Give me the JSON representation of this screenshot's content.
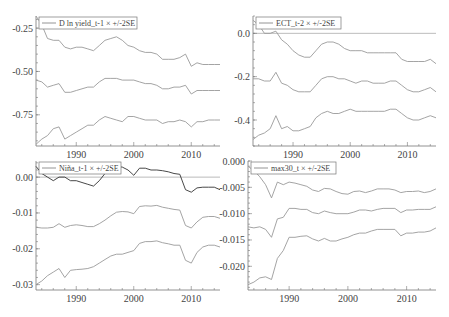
{
  "chart_data": [
    {
      "type": "line",
      "panel": "top-left",
      "legend": "D ln yield_t-1 × +/-2SE",
      "xlabel": "",
      "ylabel": "",
      "xlim": [
        1983,
        2015
      ],
      "ylim": [
        -0.93,
        -0.18
      ],
      "yticks": [
        -0.25,
        -0.5,
        -0.75
      ],
      "ytick_labels": [
        "-0.25",
        "-0.50",
        "-0.75"
      ],
      "xticks": [
        1990,
        2000,
        2010
      ],
      "xtick_labels": [
        "1990",
        "2000",
        "2010"
      ],
      "zero_line": false,
      "x": [
        1983,
        1984,
        1985,
        1986,
        1987,
        1988,
        1989,
        1990,
        1991,
        1992,
        1993,
        1994,
        1995,
        1996,
        1997,
        1998,
        1999,
        2000,
        2001,
        2002,
        2003,
        2004,
        2005,
        2006,
        2007,
        2008,
        2009,
        2010,
        2011,
        2012,
        2013,
        2014,
        2015
      ],
      "series": [
        {
          "name": "upper (+2SE)",
          "values": [
            -0.18,
            -0.23,
            -0.31,
            -0.32,
            -0.32,
            -0.36,
            -0.37,
            -0.36,
            -0.36,
            -0.37,
            -0.38,
            -0.35,
            -0.32,
            -0.31,
            -0.3,
            -0.32,
            -0.35,
            -0.36,
            -0.38,
            -0.39,
            -0.39,
            -0.4,
            -0.43,
            -0.43,
            -0.43,
            -0.42,
            -0.4,
            -0.47,
            -0.45,
            -0.46,
            -0.46,
            -0.46,
            -0.46
          ]
        },
        {
          "name": "estimate",
          "values": [
            -0.55,
            -0.56,
            -0.59,
            -0.58,
            -0.57,
            -0.62,
            -0.62,
            -0.61,
            -0.6,
            -0.59,
            -0.59,
            -0.56,
            -0.54,
            -0.54,
            -0.54,
            -0.55,
            -0.55,
            -0.55,
            -0.56,
            -0.57,
            -0.57,
            -0.58,
            -0.6,
            -0.6,
            -0.59,
            -0.59,
            -0.58,
            -0.63,
            -0.61,
            -0.61,
            -0.61,
            -0.61,
            -0.61
          ]
        },
        {
          "name": "lower (-2SE)",
          "values": [
            -0.92,
            -0.89,
            -0.87,
            -0.83,
            -0.82,
            -0.89,
            -0.87,
            -0.85,
            -0.83,
            -0.81,
            -0.81,
            -0.78,
            -0.76,
            -0.77,
            -0.78,
            -0.79,
            -0.76,
            -0.76,
            -0.77,
            -0.78,
            -0.78,
            -0.78,
            -0.8,
            -0.79,
            -0.79,
            -0.78,
            -0.79,
            -0.82,
            -0.79,
            -0.79,
            -0.78,
            -0.78,
            -0.78
          ]
        }
      ]
    },
    {
      "type": "line",
      "panel": "top-right",
      "legend": "ECT_t-2 × +/-2SE",
      "xlabel": "",
      "ylabel": "",
      "xlim": [
        1983,
        2015
      ],
      "ylim": [
        -0.52,
        0.08
      ],
      "yticks": [
        0.0,
        -0.2,
        -0.4
      ],
      "ytick_labels": [
        "0.0",
        "-0.2",
        "-0.4"
      ],
      "xticks": [
        1990,
        2000,
        2010
      ],
      "xtick_labels": [
        "1990",
        "2000",
        "2010"
      ],
      "zero_line": true,
      "x": [
        1983,
        1984,
        1985,
        1986,
        1987,
        1988,
        1989,
        1990,
        1991,
        1992,
        1993,
        1994,
        1995,
        1996,
        1997,
        1998,
        1999,
        2000,
        2001,
        2002,
        2003,
        2004,
        2005,
        2006,
        2007,
        2008,
        2009,
        2010,
        2011,
        2012,
        2013,
        2014,
        2015
      ],
      "series": [
        {
          "name": "upper (+2SE)",
          "values": [
            0.06,
            0.04,
            0.0,
            0.0,
            0.01,
            -0.03,
            -0.05,
            -0.08,
            -0.1,
            -0.11,
            -0.11,
            -0.08,
            -0.05,
            -0.04,
            -0.04,
            -0.05,
            -0.07,
            -0.08,
            -0.08,
            -0.08,
            -0.09,
            -0.09,
            -0.09,
            -0.09,
            -0.09,
            -0.09,
            -0.12,
            -0.13,
            -0.13,
            -0.13,
            -0.13,
            -0.12,
            -0.14
          ]
        },
        {
          "name": "estimate",
          "values": [
            -0.21,
            -0.21,
            -0.22,
            -0.22,
            -0.18,
            -0.23,
            -0.24,
            -0.26,
            -0.27,
            -0.27,
            -0.27,
            -0.24,
            -0.21,
            -0.2,
            -0.2,
            -0.21,
            -0.21,
            -0.22,
            -0.23,
            -0.22,
            -0.22,
            -0.23,
            -0.23,
            -0.23,
            -0.22,
            -0.22,
            -0.24,
            -0.26,
            -0.27,
            -0.27,
            -0.26,
            -0.25,
            -0.27
          ]
        },
        {
          "name": "lower (-2SE)",
          "values": [
            -0.49,
            -0.47,
            -0.46,
            -0.44,
            -0.38,
            -0.44,
            -0.43,
            -0.45,
            -0.45,
            -0.44,
            -0.43,
            -0.39,
            -0.37,
            -0.36,
            -0.37,
            -0.37,
            -0.36,
            -0.35,
            -0.36,
            -0.36,
            -0.36,
            -0.36,
            -0.36,
            -0.36,
            -0.35,
            -0.35,
            -0.37,
            -0.39,
            -0.4,
            -0.4,
            -0.39,
            -0.38,
            -0.39
          ]
        }
      ]
    },
    {
      "type": "line",
      "panel": "bottom-left",
      "legend": "Niña_t-1 × +/-2SE",
      "xlabel": "",
      "ylabel": "",
      "xlim": [
        1983,
        2015
      ],
      "ylim": [
        -0.0315,
        0.0045
      ],
      "yticks": [
        0.0,
        -0.01,
        -0.02,
        -0.03
      ],
      "ytick_labels": [
        "0.00",
        "-0.01",
        "-0.02",
        "-0.03"
      ],
      "xticks": [
        1990,
        2000,
        2010
      ],
      "xtick_labels": [
        "1990",
        "2000",
        "2010"
      ],
      "zero_line": true,
      "x": [
        1983,
        1984,
        1985,
        1986,
        1987,
        1988,
        1989,
        1990,
        1991,
        1992,
        1993,
        1994,
        1995,
        1996,
        1997,
        1998,
        1999,
        2000,
        2001,
        2002,
        2003,
        2004,
        2005,
        2006,
        2007,
        2008,
        2009,
        2010,
        2011,
        2012,
        2013,
        2014,
        2015
      ],
      "series": [
        {
          "name": "upper (+2SE)",
          "values": [
            0.003,
            0.001,
            0.0,
            -0.001,
            0.0,
            0.0,
            -0.001,
            -0.001,
            -0.0015,
            -0.002,
            -0.0025,
            -0.001,
            0.001,
            0.002,
            0.003,
            0.0028,
            0.002,
            0.0005,
            0.0025,
            0.0025,
            0.002,
            0.002,
            0.0018,
            0.0015,
            0.001,
            0.0008,
            -0.0035,
            -0.0042,
            -0.003,
            -0.0028,
            -0.0028,
            -0.0028,
            -0.0035
          ]
        },
        {
          "name": "estimate",
          "values": [
            -0.014,
            -0.0142,
            -0.0142,
            -0.014,
            -0.013,
            -0.014,
            -0.0135,
            -0.0133,
            -0.0135,
            -0.0138,
            -0.0138,
            -0.013,
            -0.012,
            -0.0108,
            -0.0098,
            -0.0096,
            -0.0097,
            -0.0102,
            -0.0082,
            -0.008,
            -0.0081,
            -0.0079,
            -0.0084,
            -0.0087,
            -0.009,
            -0.0092,
            -0.0135,
            -0.0142,
            -0.0125,
            -0.0112,
            -0.011,
            -0.011,
            -0.0115
          ]
        },
        {
          "name": "lower (-2SE)",
          "values": [
            -0.03,
            -0.029,
            -0.0275,
            -0.0265,
            -0.0255,
            -0.028,
            -0.026,
            -0.0258,
            -0.0257,
            -0.0255,
            -0.025,
            -0.024,
            -0.023,
            -0.022,
            -0.0215,
            -0.0215,
            -0.021,
            -0.0205,
            -0.0185,
            -0.018,
            -0.018,
            -0.0178,
            -0.0183,
            -0.0186,
            -0.019,
            -0.019,
            -0.0232,
            -0.024,
            -0.021,
            -0.0195,
            -0.019,
            -0.019,
            -0.0195
          ]
        }
      ]
    },
    {
      "type": "line",
      "panel": "bottom-right",
      "legend": "max30_t × +/-2SE",
      "xlabel": "",
      "ylabel": "",
      "xlim": [
        1983,
        2015
      ],
      "ylim": [
        -0.0245,
        0.0
      ],
      "yticks": [
        0.0,
        -0.005,
        -0.01,
        -0.015,
        -0.02
      ],
      "ytick_labels": [
        "0.000",
        "-0.005",
        "-0.010",
        "-0.015",
        "-0.020"
      ],
      "xticks": [
        1990,
        2000,
        2010
      ],
      "xtick_labels": [
        "1990",
        "2000",
        "2010"
      ],
      "zero_line": false,
      "x": [
        1983,
        1984,
        1985,
        1986,
        1987,
        1988,
        1989,
        1990,
        1991,
        1992,
        1993,
        1994,
        1995,
        1996,
        1997,
        1998,
        1999,
        2000,
        2001,
        2002,
        2003,
        2004,
        2005,
        2006,
        2007,
        2008,
        2009,
        2010,
        2011,
        2012,
        2013,
        2014,
        2015
      ],
      "series": [
        {
          "name": "upper (+2SE)",
          "values": [
            -0.001,
            -0.0018,
            -0.003,
            -0.0045,
            -0.007,
            -0.004,
            -0.0045,
            -0.004,
            -0.0042,
            -0.0045,
            -0.0048,
            -0.0055,
            -0.0058,
            -0.0052,
            -0.0053,
            -0.0058,
            -0.0062,
            -0.0063,
            -0.0058,
            -0.0057,
            -0.006,
            -0.0057,
            -0.0053,
            -0.0053,
            -0.0053,
            -0.0055,
            -0.006,
            -0.0058,
            -0.0058,
            -0.0057,
            -0.006,
            -0.0058,
            -0.0053
          ]
        },
        {
          "name": "estimate",
          "values": [
            -0.0125,
            -0.0127,
            -0.0125,
            -0.013,
            -0.0145,
            -0.011,
            -0.0107,
            -0.009,
            -0.009,
            -0.0092,
            -0.0092,
            -0.0098,
            -0.01,
            -0.0095,
            -0.0098,
            -0.01,
            -0.01,
            -0.01,
            -0.0097,
            -0.0093,
            -0.0093,
            -0.0095,
            -0.0092,
            -0.009,
            -0.009,
            -0.009,
            -0.0098,
            -0.0093,
            -0.0093,
            -0.0092,
            -0.0092,
            -0.0092,
            -0.0087
          ]
        },
        {
          "name": "lower (-2SE)",
          "values": [
            -0.0235,
            -0.023,
            -0.0222,
            -0.022,
            -0.0225,
            -0.0185,
            -0.017,
            -0.0145,
            -0.0145,
            -0.0143,
            -0.0142,
            -0.0148,
            -0.0152,
            -0.0147,
            -0.0152,
            -0.0152,
            -0.0148,
            -0.0145,
            -0.014,
            -0.0137,
            -0.0137,
            -0.0133,
            -0.013,
            -0.013,
            -0.013,
            -0.013,
            -0.0142,
            -0.0137,
            -0.0137,
            -0.0135,
            -0.0135,
            -0.0133,
            -0.0127
          ]
        }
      ]
    }
  ],
  "layout": {
    "panels": [
      {
        "left": 36,
        "top": 16,
        "right": 220,
        "bottom": 146,
        "label_x": 33
      },
      {
        "left": 253,
        "top": 16,
        "right": 436,
        "bottom": 146,
        "label_x": 250
      },
      {
        "left": 36,
        "top": 161,
        "right": 220,
        "bottom": 290,
        "label_x": 33
      },
      {
        "left": 248,
        "top": 161,
        "right": 436,
        "bottom": 290,
        "label_x": 245
      }
    ],
    "legend_boxes": [
      {
        "x": 39,
        "y": 17,
        "w": 98,
        "h": 12
      },
      {
        "x": 256,
        "y": 17,
        "w": 85,
        "h": 12
      },
      {
        "x": 39,
        "y": 162,
        "w": 82,
        "h": 12
      },
      {
        "x": 251,
        "y": 162,
        "w": 85,
        "h": 12
      }
    ]
  }
}
